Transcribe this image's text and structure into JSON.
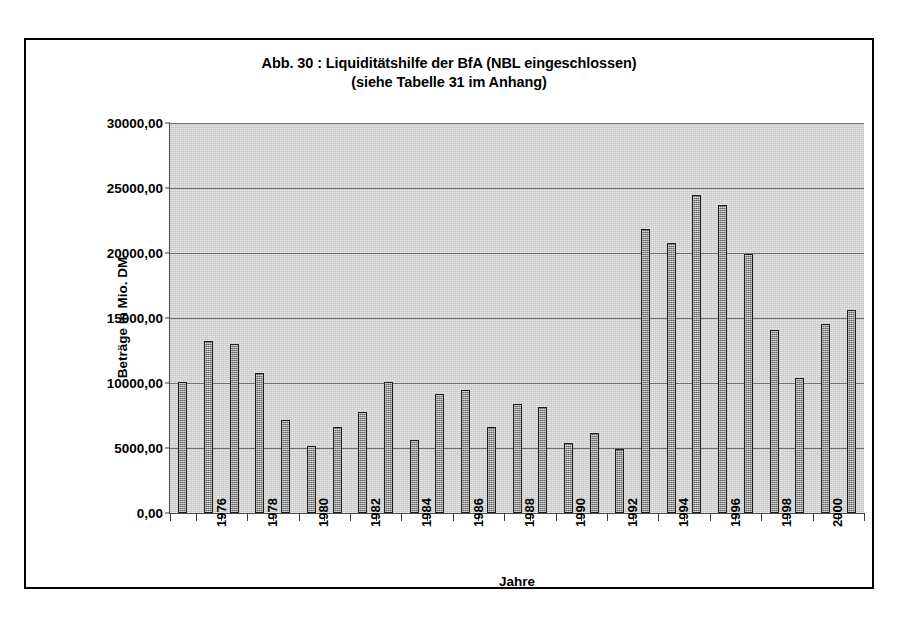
{
  "chart_data": {
    "type": "bar",
    "title": "Abb. 30 : Liquiditätshilfe der BfA (NBL eingeschlossen)",
    "subtitle": "(siehe Tabelle 31 im Anhang)",
    "xlabel": "Jahre",
    "ylabel": "Beträge in Mio. DM",
    "ylim": [
      0,
      30000
    ],
    "grid": true,
    "legend": "none",
    "categories": [
      "1975",
      "1976",
      "1977",
      "1978",
      "1979",
      "1980",
      "1981",
      "1982",
      "1983",
      "1984",
      "1985",
      "1986",
      "1987",
      "1988",
      "1989",
      "1990",
      "1991",
      "1992",
      "1993",
      "1994",
      "1995",
      "1996",
      "1997",
      "1998",
      "1999",
      "2000",
      "2001"
    ],
    "values": [
      10050,
      13250,
      13000,
      10800,
      7150,
      5150,
      6600,
      7800,
      10100,
      5650,
      9150,
      9500,
      6650,
      8350,
      8150,
      5400,
      6150,
      4900,
      21850,
      20800,
      24450,
      23700,
      19950,
      14050,
      10400,
      14550,
      15600
    ],
    "ytick_labels": [
      "30000,00",
      "25000,00",
      "20000,00",
      "15000,00",
      "10000,00",
      "5000,00",
      "0,00"
    ],
    "ytick_values": [
      30000,
      25000,
      20000,
      15000,
      10000,
      5000,
      0
    ],
    "xtick_labels": [
      "1976",
      "1978",
      "1980",
      "1982",
      "1984",
      "1986",
      "1988",
      "1990",
      "1992",
      "1994",
      "1996",
      "1998",
      "2000"
    ],
    "xtick_categories": [
      "1976",
      "1978",
      "1980",
      "1982",
      "1984",
      "1986",
      "1988",
      "1990",
      "1992",
      "1994",
      "1996",
      "1998",
      "2000"
    ],
    "colors": {
      "bar_fill": "#8f8f8f",
      "bar_border": "#1c1c1c",
      "plot_background": "#d4d4d4",
      "gridline": "#6e6e6e",
      "axis": "#4a4a4a",
      "frame": "#000000",
      "text": "#000000",
      "page_background": "#ffffff"
    }
  }
}
